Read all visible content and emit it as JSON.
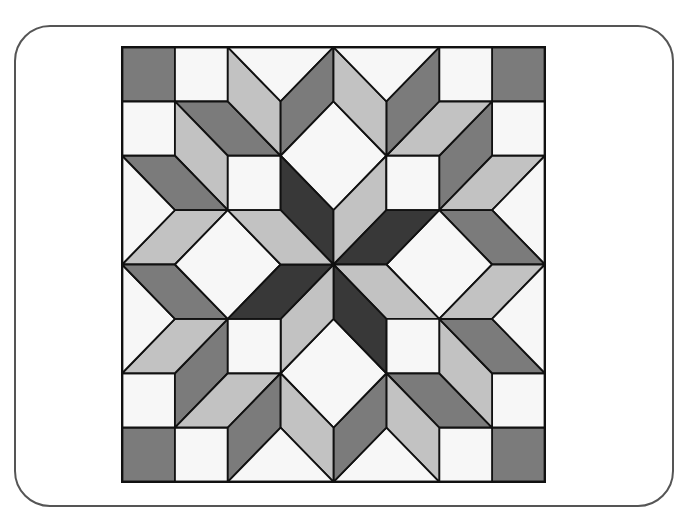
{
  "colors": {
    "white": "#f7f7f7",
    "light": "#c2c2c2",
    "medium": "#7b7b7b",
    "dark": "#383838",
    "stroke": "#111111",
    "card_border": "#555555"
  },
  "block": {
    "grid": 8,
    "origin_px": [
      122,
      47
    ],
    "size_px": [
      423,
      435
    ],
    "symmetry": "4-fold rotational about center (4,4)",
    "fundamental_pieces": [
      {
        "name": "corner-square",
        "fill": "medium",
        "points": [
          [
            0,
            0
          ],
          [
            1,
            0
          ],
          [
            1,
            1
          ],
          [
            0,
            1
          ]
        ]
      },
      {
        "name": "edge-square-a",
        "fill": "white",
        "points": [
          [
            1,
            0
          ],
          [
            2,
            0
          ],
          [
            2,
            1
          ],
          [
            1,
            1
          ]
        ]
      },
      {
        "name": "edge-square-b",
        "fill": "white",
        "points": [
          [
            0,
            1
          ],
          [
            1,
            1
          ],
          [
            1,
            2
          ],
          [
            0,
            2
          ]
        ]
      },
      {
        "name": "corner-star-horizontal",
        "fill": "medium",
        "points": [
          [
            1,
            1
          ],
          [
            2,
            1
          ],
          [
            3,
            2
          ],
          [
            2,
            2
          ]
        ]
      },
      {
        "name": "corner-star-vertical",
        "fill": "light",
        "points": [
          [
            1,
            1
          ],
          [
            2,
            2
          ],
          [
            2,
            3
          ],
          [
            1,
            2
          ]
        ]
      },
      {
        "name": "inner-square",
        "fill": "white",
        "points": [
          [
            2,
            2
          ],
          [
            3,
            2
          ],
          [
            3,
            3
          ],
          [
            2,
            3
          ]
        ]
      },
      {
        "name": "top-diamond-left",
        "fill": "light",
        "points": [
          [
            2,
            0
          ],
          [
            3,
            1
          ],
          [
            3,
            2
          ],
          [
            2,
            1
          ]
        ]
      },
      {
        "name": "left-diamond-top",
        "fill": "medium",
        "points": [
          [
            0,
            2
          ],
          [
            1,
            2
          ],
          [
            2,
            3
          ],
          [
            1,
            3
          ]
        ]
      },
      {
        "name": "top-notch",
        "fill": "white",
        "points": [
          [
            2,
            0
          ],
          [
            4,
            0
          ],
          [
            3,
            1
          ]
        ]
      },
      {
        "name": "top-diamond-right",
        "fill": "medium",
        "points": [
          [
            3,
            1
          ],
          [
            4,
            0
          ],
          [
            4,
            1
          ],
          [
            3,
            2
          ]
        ]
      },
      {
        "name": "left-diamond-mid",
        "fill": "light",
        "points": [
          [
            0,
            4
          ],
          [
            1,
            3
          ],
          [
            2,
            3
          ],
          [
            1,
            4
          ]
        ]
      },
      {
        "name": "left-notch",
        "fill": "white",
        "points": [
          [
            0,
            2
          ],
          [
            1,
            3
          ],
          [
            0,
            4
          ]
        ]
      },
      {
        "name": "white-diamond",
        "fill": "white",
        "points": [
          [
            4,
            1
          ],
          [
            5,
            2
          ],
          [
            4,
            3
          ],
          [
            3,
            2
          ]
        ]
      },
      {
        "name": "center-star-dark",
        "fill": "dark",
        "points": [
          [
            3,
            2
          ],
          [
            4,
            3
          ],
          [
            4,
            4
          ],
          [
            3,
            3
          ]
        ]
      },
      {
        "name": "center-star-light",
        "fill": "light",
        "points": [
          [
            4,
            3
          ],
          [
            5,
            2
          ],
          [
            5,
            3
          ],
          [
            4,
            4
          ]
        ]
      }
    ]
  }
}
